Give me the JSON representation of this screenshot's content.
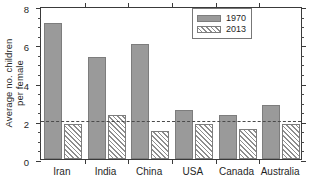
{
  "chart_data": {
    "type": "bar",
    "title": "",
    "xlabel": "",
    "ylabel_line1": "Average no. children",
    "ylabel_line2": "per female",
    "categories": [
      "Iran",
      "India",
      "China",
      "USA",
      "Canada",
      "Australia"
    ],
    "series": [
      {
        "name": "1970",
        "values": [
          7.1,
          5.35,
          6.0,
          2.55,
          2.3,
          2.85
        ],
        "style": "solid",
        "color": "#9a9a9a"
      },
      {
        "name": "2013",
        "values": [
          1.85,
          2.3,
          1.45,
          1.85,
          1.55,
          1.85
        ],
        "style": "hatch",
        "color": "#ffffff"
      }
    ],
    "ylim": [
      0,
      8
    ],
    "yticks": [
      0,
      2,
      4,
      6,
      8
    ],
    "ytick_labels": [
      "0",
      "2",
      "4",
      "6",
      "8"
    ],
    "yminor_step": 0.5,
    "grid": false,
    "legend_position": "top-right",
    "legend_entries": [
      "1970",
      "2013"
    ],
    "annotations": [
      {
        "type": "hline",
        "value": 2.1,
        "style": "dashed",
        "color": "#4a4a4a",
        "label": ""
      }
    ]
  }
}
